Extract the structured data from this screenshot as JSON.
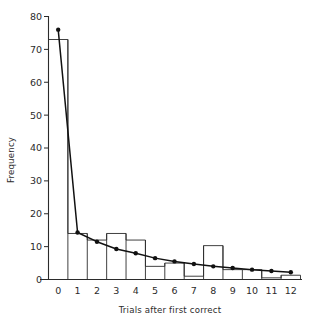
{
  "chart_data": {
    "type": "bar",
    "title": "",
    "xlabel": "Trials after first correct",
    "ylabel": "Frequency",
    "xlim": [
      -0.5,
      12.5
    ],
    "ylim": [
      0,
      80
    ],
    "grid": false,
    "legend": "none",
    "categories": [
      "0",
      "1",
      "2",
      "3",
      "4",
      "5",
      "6",
      "7",
      "8",
      "9",
      "10",
      "11",
      "12"
    ],
    "xticklabels": [
      "0",
      "1",
      "2",
      "3",
      "4",
      "5",
      "6",
      "7",
      "8",
      "9",
      "10",
      "11",
      "12"
    ],
    "yticklabels": [
      "0",
      "10",
      "20",
      "30",
      "40",
      "50",
      "60",
      "70",
      "80"
    ],
    "ytickvalues": [
      0,
      10,
      20,
      30,
      40,
      50,
      60,
      70,
      80
    ],
    "series": [
      {
        "name": "Observed frequency",
        "type": "bar",
        "values": [
          73,
          14,
          12,
          14,
          12,
          4,
          5,
          1,
          10.3,
          3,
          3,
          0.5,
          1.3
        ]
      },
      {
        "name": "Fitted curve",
        "type": "line",
        "marker": "filled-circle",
        "values": [
          76,
          14.3,
          11.5,
          9.3,
          8.0,
          6.5,
          5.5,
          4.7,
          4.0,
          3.5,
          3.0,
          2.6,
          2.2
        ]
      }
    ],
    "colors": {
      "bar_edge": "#2b2b2b",
      "curve": "#111111",
      "axis": "#2b2b2b",
      "background": "#ffffff"
    }
  }
}
